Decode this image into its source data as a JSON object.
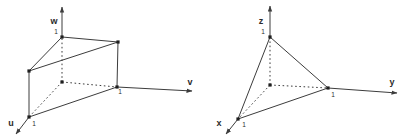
{
  "canvas": {
    "width": 409,
    "height": 139,
    "background": "#ffffff"
  },
  "style": {
    "line_color": "#3c3c3c",
    "dot_color": "#1f1f1f",
    "label_color": "#2b2b2b",
    "dash_pattern": "1.6 2.6",
    "line_width": 1,
    "dot_size": 3.2,
    "axis_label_size": 9,
    "tick_label_size": 6.5
  },
  "figures": [
    {
      "id": "uvw-prism",
      "axes": [
        {
          "name": "w-axis",
          "line": [
            62,
            37,
            62,
            7
          ]
        },
        {
          "name": "v-axis",
          "line": [
            117,
            87,
            192,
            91
          ]
        },
        {
          "name": "u-axis",
          "line": [
            29,
            117,
            16,
            134
          ]
        }
      ],
      "solid_edges": [
        [
          62,
          37,
          29,
          71
        ],
        [
          62,
          37,
          118,
          42
        ],
        [
          29,
          71,
          118,
          42
        ],
        [
          29,
          71,
          29,
          117
        ],
        [
          29,
          117,
          117,
          87
        ],
        [
          117,
          87,
          118,
          42
        ]
      ],
      "dashed_edges": [
        [
          62,
          82,
          62,
          37
        ],
        [
          62,
          82,
          29,
          117
        ],
        [
          62,
          82,
          117,
          87
        ]
      ],
      "vertices": [
        [
          62,
          37
        ],
        [
          29,
          71
        ],
        [
          118,
          42
        ],
        [
          29,
          117
        ],
        [
          117,
          87
        ],
        [
          62,
          82
        ]
      ],
      "axis_labels": [
        {
          "text": "w",
          "x": 54,
          "y": 24
        },
        {
          "text": "v",
          "x": 190,
          "y": 85
        },
        {
          "text": "u",
          "x": 11,
          "y": 126
        }
      ],
      "tick_labels": [
        {
          "text": "1",
          "x": 56,
          "y": 34
        },
        {
          "text": "1",
          "x": 34,
          "y": 126
        },
        {
          "text": "1",
          "x": 120,
          "y": 94
        }
      ]
    },
    {
      "id": "xyz-simplex",
      "axes": [
        {
          "name": "z-axis",
          "line": [
            270,
            37,
            270,
            6
          ]
        },
        {
          "name": "y-axis",
          "line": [
            328,
            88,
            397,
            93
          ]
        },
        {
          "name": "x-axis",
          "line": [
            238,
            119,
            226,
            134
          ]
        }
      ],
      "solid_edges": [
        [
          270,
          37,
          238,
          119
        ],
        [
          270,
          37,
          328,
          88
        ],
        [
          238,
          119,
          328,
          88
        ]
      ],
      "dashed_edges": [
        [
          270,
          85,
          270,
          37
        ],
        [
          270,
          85,
          238,
          119
        ],
        [
          270,
          85,
          328,
          88
        ]
      ],
      "vertices": [
        [
          270,
          37
        ],
        [
          238,
          119
        ],
        [
          328,
          88
        ],
        [
          270,
          85
        ]
      ],
      "axis_labels": [
        {
          "text": "z",
          "x": 261,
          "y": 24
        },
        {
          "text": "y",
          "x": 392,
          "y": 85
        },
        {
          "text": "x",
          "x": 219,
          "y": 126
        }
      ],
      "tick_labels": [
        {
          "text": "1",
          "x": 263,
          "y": 34
        },
        {
          "text": "1",
          "x": 244,
          "y": 127
        },
        {
          "text": "1",
          "x": 333,
          "y": 97
        }
      ]
    }
  ]
}
